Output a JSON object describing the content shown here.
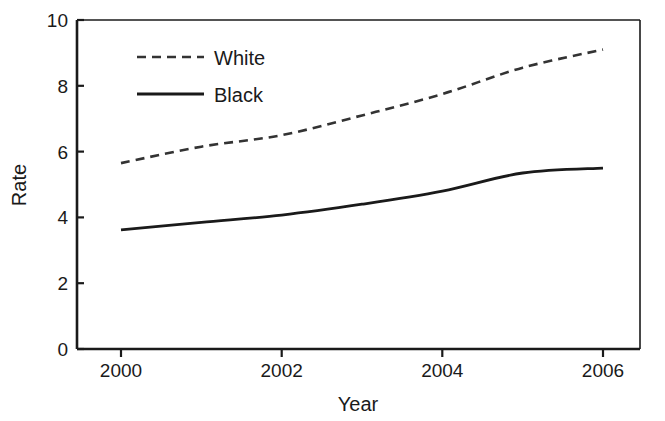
{
  "chart_data": {
    "type": "line",
    "title": "",
    "xlabel": "Year",
    "ylabel": "Rate",
    "xlim": [
      1999.5,
      2006.6
    ],
    "ylim": [
      0,
      10
    ],
    "xticks": [
      "2000",
      "2002",
      "2004",
      "2006"
    ],
    "xtick_values": [
      2000,
      2002,
      2004,
      2006
    ],
    "yticks": [
      "0",
      "2",
      "4",
      "6",
      "8",
      "10"
    ],
    "ytick_values": [
      0,
      2,
      4,
      6,
      8,
      10
    ],
    "grid": false,
    "legend_position": "upper-left-inside",
    "x": [
      2000,
      2001,
      2002,
      2003,
      2004,
      2005,
      2006
    ],
    "series": [
      {
        "name": "White",
        "style": "dashed",
        "color": "#333333",
        "values": [
          5.65,
          6.15,
          6.5,
          7.1,
          7.75,
          8.55,
          9.1
        ]
      },
      {
        "name": "Black",
        "style": "solid",
        "color": "#1a1a1a",
        "values": [
          3.62,
          3.85,
          4.07,
          4.4,
          4.8,
          5.35,
          5.5
        ]
      }
    ]
  },
  "legend": {
    "entries": [
      {
        "label": "White",
        "style": "dashed"
      },
      {
        "label": "Black",
        "style": "solid"
      }
    ]
  },
  "axes": {
    "x_title": "Year",
    "y_title": "Rate"
  }
}
